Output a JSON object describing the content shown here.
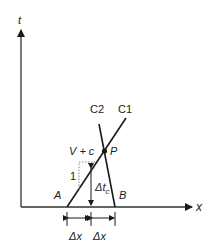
{
  "diagram": {
    "axes": {
      "y_label": "t",
      "x_label": "x"
    },
    "characteristics": {
      "c1_label": "C1",
      "c2_label": "C2"
    },
    "points": {
      "a_label": "A",
      "b_label": "B",
      "p_label": "P"
    },
    "slope": {
      "speed_label": "V + c",
      "unit_label": "1"
    },
    "intervals": {
      "dt_label": "Δt",
      "dt_subscript": "c",
      "dx_left_label": "Δx",
      "dx_right_label": "Δx"
    },
    "colors": {
      "line": "#1a1a1a",
      "axis": "#333333",
      "dotted": "#888888"
    }
  }
}
